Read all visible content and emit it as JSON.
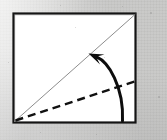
{
  "figure": {
    "caption": "",
    "canvas": {
      "width": 167,
      "height": 140
    },
    "background": {
      "color": "#cfcfcd",
      "description": "scanned gray paper background"
    }
  },
  "paper": {
    "label": "square sheet",
    "fill": "#ffffff",
    "stroke": "#141414",
    "stroke_width": 2.2,
    "corners": {
      "top_left": [
        13.5,
        13.5
      ],
      "top_right": [
        135.5,
        13.5
      ],
      "bottom_right": [
        135.5,
        122.5
      ],
      "bottom_left": [
        13.5,
        122.5
      ]
    }
  },
  "creases": [
    {
      "name": "existing-diagonal-crease",
      "style": "solid-thin",
      "color": "#8d8d8d",
      "stroke_width": 1.0,
      "from": [
        14.5,
        121.5
      ],
      "to": [
        135.0,
        14.5
      ]
    },
    {
      "name": "valley-fold-line",
      "style": "dashed",
      "color": "#111111",
      "stroke_width": 2.4,
      "dash_pattern": "8 5",
      "from": [
        15.5,
        120.5
      ],
      "to": [
        136.0,
        81.0
      ]
    }
  ],
  "arrow": {
    "name": "fold-direction-arrow",
    "color": "#0d0d0d",
    "stroke_width": 3.0,
    "tail": [
      122.5,
      121.0
    ],
    "control_1": [
      124.0,
      86.0
    ],
    "control_2": [
      108.0,
      62.0
    ],
    "tip": [
      88.5,
      53.5
    ],
    "head": {
      "length": 15,
      "width": 11
    },
    "description": "curved arrow from bottom-right sweeping up-left to the diagonal crease"
  },
  "specks": [
    {
      "x": 150,
      "y": 12,
      "d": 2
    },
    {
      "x": 122,
      "y": 6,
      "d": 1
    },
    {
      "x": 60,
      "y": 5,
      "d": 1
    },
    {
      "x": 8,
      "y": 62,
      "d": 1
    },
    {
      "x": 158,
      "y": 96,
      "d": 2
    },
    {
      "x": 96,
      "y": 134,
      "d": 1
    },
    {
      "x": 40,
      "y": 132,
      "d": 1
    },
    {
      "x": 75,
      "y": 27,
      "d": 1
    },
    {
      "x": 104,
      "y": 57,
      "d": 1
    }
  ]
}
